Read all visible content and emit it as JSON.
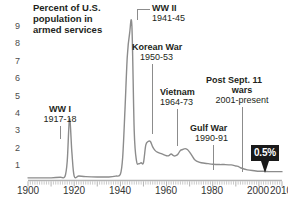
{
  "chart_title": "Percent of U.S.\npopulation in\narmed services",
  "axes": {
    "y_ticks": [
      "1",
      "2",
      "3",
      "4",
      "5",
      "6",
      "7",
      "8",
      "9"
    ],
    "x_ticks": [
      "1900",
      "1920",
      "1940",
      "1960",
      "1980",
      "2000",
      "2010"
    ]
  },
  "annotations": {
    "ww1": {
      "name": "WW I",
      "years": "1917-18"
    },
    "ww2": {
      "name": "WW II",
      "years": "1941-45"
    },
    "korea": {
      "name": "Korean War",
      "years": "1950-53"
    },
    "vietnam": {
      "name": "Vietnam",
      "years": "1964-73"
    },
    "gulf": {
      "name": "Gulf War",
      "years": "1990-91"
    },
    "post911": {
      "name": "Post Sept. 11",
      "name2": "wars",
      "years": "2001-present"
    }
  },
  "callout": {
    "value": "0.5%"
  },
  "colors": {
    "line": "#8c8c8c",
    "axis": "#bfbfbf",
    "text": "#231f20",
    "callout_bg": "#1a1a1a",
    "callout_text": "#ffffff"
  },
  "chart_data": {
    "type": "line",
    "title": "Percent of U.S. population in armed services",
    "xlabel": "Year",
    "ylabel": "Percent of U.S. population in armed services",
    "xlim": [
      1900,
      2010
    ],
    "ylim": [
      0,
      9.4
    ],
    "grid": false,
    "legend": "none",
    "x": [
      1900,
      1905,
      1910,
      1914,
      1916,
      1917,
      1918,
      1919,
      1920,
      1922,
      1925,
      1930,
      1935,
      1938,
      1940,
      1941,
      1942,
      1943,
      1944,
      1945,
      1946,
      1947,
      1948,
      1949,
      1950,
      1951,
      1952,
      1953,
      1954,
      1955,
      1956,
      1958,
      1960,
      1961,
      1962,
      1963,
      1964,
      1965,
      1966,
      1967,
      1968,
      1969,
      1970,
      1971,
      1972,
      1973,
      1975,
      1978,
      1980,
      1983,
      1985,
      1988,
      1990,
      1991,
      1992,
      1995,
      1998,
      2000,
      2002,
      2005,
      2008,
      2010
    ],
    "y": [
      0.15,
      0.15,
      0.15,
      0.18,
      0.22,
      1.1,
      3.5,
      1.6,
      0.25,
      0.25,
      0.22,
      0.2,
      0.2,
      0.25,
      0.35,
      1.3,
      4.0,
      7.0,
      8.3,
      8.7,
      2.8,
      1.1,
      0.95,
      1.0,
      1.0,
      2.0,
      2.2,
      2.2,
      1.9,
      1.7,
      1.6,
      1.5,
      1.4,
      1.4,
      1.5,
      1.4,
      1.4,
      1.5,
      1.7,
      1.75,
      1.8,
      1.75,
      1.6,
      1.4,
      1.2,
      1.1,
      1.0,
      0.95,
      0.92,
      0.9,
      0.9,
      0.88,
      0.82,
      0.8,
      0.72,
      0.6,
      0.55,
      0.52,
      0.52,
      0.5,
      0.5,
      0.5
    ],
    "events": [
      {
        "label": "WW I",
        "years": "1917-18",
        "peak_value": 3.5
      },
      {
        "label": "WW II",
        "years": "1941-45",
        "peak_value": 8.7
      },
      {
        "label": "Korean War",
        "years": "1950-53",
        "peak_value": 2.2
      },
      {
        "label": "Vietnam",
        "years": "1964-73",
        "peak_value": 1.8
      },
      {
        "label": "Gulf War",
        "years": "1990-91",
        "peak_value": 0.8
      },
      {
        "label": "Post Sept. 11 wars",
        "years": "2001-present",
        "peak_value": 0.5
      }
    ],
    "callout": {
      "label": "0.5%",
      "x": 2010,
      "y": 0.5
    }
  }
}
